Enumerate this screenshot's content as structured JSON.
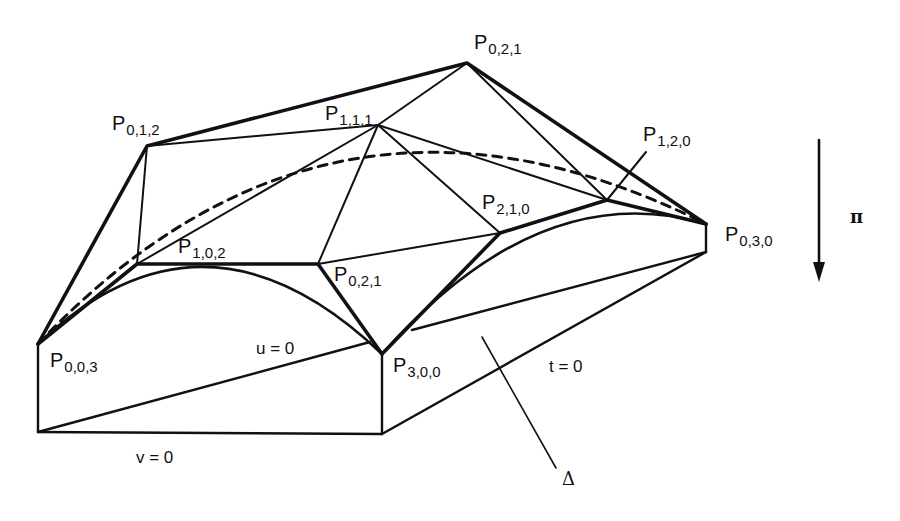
{
  "figure": {
    "control_points": [
      {
        "id": "p012",
        "base": "P",
        "sub": "0,1,2"
      },
      {
        "id": "p021_top",
        "base": "P",
        "sub": "0,2,1"
      },
      {
        "id": "p111",
        "base": "P",
        "sub": "1,1,1"
      },
      {
        "id": "p120",
        "base": "P",
        "sub": "1,2,0"
      },
      {
        "id": "p102",
        "base": "P",
        "sub": "1,0,2"
      },
      {
        "id": "p210",
        "base": "P",
        "sub": "2,1,0"
      },
      {
        "id": "p021_mid",
        "base": "P",
        "sub": "0,2,1"
      },
      {
        "id": "p030",
        "base": "P",
        "sub": "0,3,0"
      },
      {
        "id": "p003",
        "base": "P",
        "sub": "0,0,3"
      },
      {
        "id": "p300",
        "base": "P",
        "sub": "3,0,0"
      }
    ],
    "boundary_labels": {
      "u": "u = 0",
      "v": "v = 0",
      "t": "t = 0"
    },
    "domain_label": "Δ",
    "projection_label": "π",
    "colors": {
      "ink": "#111111",
      "background": "#ffffff"
    }
  }
}
